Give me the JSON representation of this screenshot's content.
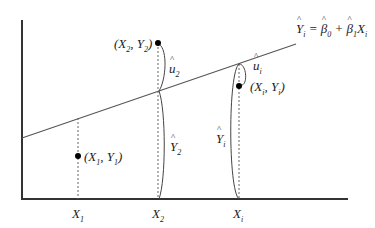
{
  "diagram": {
    "type": "regression-line-illustration",
    "equation": {
      "lhs": "Y",
      "lhs_sub": "i",
      "b0": "β",
      "b0_sub": "0",
      "b1": "β",
      "b1_sub": "1",
      "x": "X",
      "x_sub": "i",
      "text": "Ŷi = β̂0 + β̂1 Xi"
    },
    "points": [
      {
        "label": "(X1, Y1)",
        "x_name": "X",
        "x_sub": "1",
        "y_name": "Y",
        "y_sub": "1"
      },
      {
        "label": "(X2, Y2)",
        "x_name": "X",
        "x_sub": "2",
        "y_name": "Y",
        "y_sub": "2"
      },
      {
        "label": "(Xi, Yi)",
        "x_name": "X",
        "x_sub": "i",
        "y_name": "Y",
        "y_sub": "i"
      }
    ],
    "x_ticks": [
      {
        "name": "X",
        "sub": "1"
      },
      {
        "name": "X",
        "sub": "2"
      },
      {
        "name": "X",
        "sub": "i"
      }
    ],
    "residuals": [
      {
        "name": "u",
        "sub": "2",
        "hat": true
      },
      {
        "name": "u",
        "sub": "i",
        "hat": true
      }
    ],
    "fitted": [
      {
        "name": "Y",
        "sub": "2",
        "hat": true
      },
      {
        "name": "Y",
        "sub": "i",
        "hat": true
      }
    ],
    "colors": {
      "axis": "#333333",
      "line": "#555555",
      "point": "#000000",
      "dashed": "#666666"
    }
  }
}
